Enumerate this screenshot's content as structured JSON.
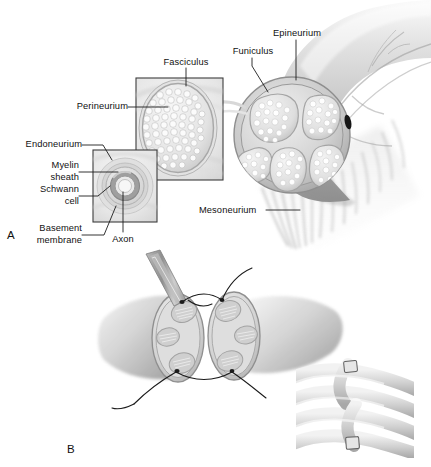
{
  "figure": {
    "background_color": "#ffffff",
    "ink_color": "#111111",
    "panels": [
      {
        "id": "A",
        "letter": "A",
        "caption": "Cross-sectional anatomy of a peripheral nerve trunk with magnified insets"
      },
      {
        "id": "B",
        "letter": "B",
        "caption": "Epineurial suture repair of a transected nerve and coiled nerve segment detail"
      }
    ]
  },
  "panel_a": {
    "letter": "A",
    "labels": {
      "fasciculus": "Fasciculus",
      "perineurium": "Perineurium",
      "endoneurium": "Endoneurium",
      "myelin_sheath_line1": "Myelin",
      "myelin_sheath_line2": "sheath",
      "schwann_cell_line1": "Schwann",
      "schwann_cell_line2": "cell",
      "basement_membrane_line1": "Basement",
      "basement_membrane_line2": "membrane",
      "axon": "Axon",
      "epineurium": "Epineurium",
      "funiculus": "Funiculus",
      "mesoneurium": "Mesoneurium"
    },
    "nerve_trunk": {
      "funiculus_count": 5,
      "has_epineurium_ring": true,
      "has_mesoneurium_fringe": true,
      "marker_dot": "black-reference-dot"
    },
    "fascicle_inset": {
      "shape": "oval",
      "axon_count_appearance": "many-small-circles"
    },
    "axon_inset": {
      "rings": [
        "endoneurium",
        "basement membrane",
        "Schwann cell",
        "myelin sheath",
        "axon"
      ]
    }
  },
  "panel_b": {
    "letter": "B",
    "repair": {
      "stump_count": 2,
      "funiculi_per_stump": 3,
      "suture_count": 3,
      "instrument": "needle-holder",
      "description": "two apposed nerve stumps joined by epineurial sutures"
    },
    "coil_inset": {
      "description": "coiled nerve segment with marking clips",
      "clip_count": 2
    }
  },
  "colors": {
    "ink": "#111111",
    "leader": "#1d1d1d",
    "nerve_light": "#e9e9e9",
    "nerve_mid": "#cfcfcf",
    "nerve_dark": "#a9a9a9",
    "nerve_shadow": "#8c8c8c",
    "inset_box_border": "#3a3a3a",
    "inset_fill": "#ededed",
    "funiculus_fill": "#dcdcdc",
    "axon_fill": "#f2f2f2",
    "suture": "#1b1b1b"
  }
}
